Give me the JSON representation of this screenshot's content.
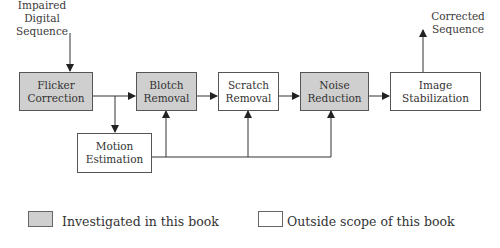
{
  "diagram": {
    "input_label": [
      "Impaired",
      "Digital",
      "Sequence"
    ],
    "output_label": [
      "Corrected",
      "Sequence"
    ],
    "blocks": [
      {
        "id": "flicker",
        "lines": [
          "Flicker",
          "Correction"
        ],
        "category": "investigated"
      },
      {
        "id": "blotch",
        "lines": [
          "Blotch",
          "Removal"
        ],
        "category": "investigated"
      },
      {
        "id": "scratch",
        "lines": [
          "Scratch",
          "Removal"
        ],
        "category": "outside"
      },
      {
        "id": "noise",
        "lines": [
          "Noise",
          "Reduction"
        ],
        "category": "investigated"
      },
      {
        "id": "stabilization",
        "lines": [
          "Image",
          "Stabilization"
        ],
        "category": "outside"
      },
      {
        "id": "motion",
        "lines": [
          "Motion",
          "Estimation"
        ],
        "category": "outside"
      }
    ],
    "edges": [
      [
        "input",
        "flicker"
      ],
      [
        "flicker",
        "blotch"
      ],
      [
        "blotch",
        "scratch"
      ],
      [
        "scratch",
        "noise"
      ],
      [
        "noise",
        "stabilization"
      ],
      [
        "stabilization",
        "output"
      ],
      [
        "flicker",
        "motion"
      ],
      [
        "motion",
        "blotch"
      ],
      [
        "motion",
        "scratch"
      ],
      [
        "motion",
        "noise"
      ]
    ],
    "colors": {
      "investigated": "#cfcfcf",
      "outside": "#ffffff",
      "line": "#333333"
    }
  },
  "legend": {
    "investigated_label": "Investigated in this book",
    "outside_label": "Outside scope of this book"
  }
}
